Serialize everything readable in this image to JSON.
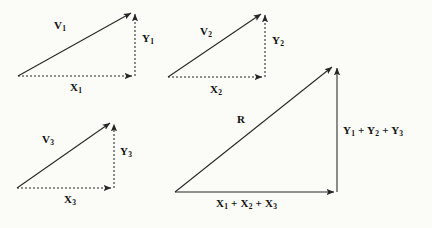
{
  "figure": {
    "type": "vector-addition-diagram",
    "background_color": "#fbfbf8",
    "line_color": "#262626",
    "text_color": "#101010"
  },
  "triangles": [
    {
      "id": "triangle-1",
      "vector_label": "V",
      "vector_sub": "1",
      "y_label": "Y",
      "y_sub": "1",
      "x_label": "X",
      "x_sub": "1",
      "origin": [
        18,
        76
      ],
      "apex": [
        134,
        11
      ],
      "corner": [
        134,
        76
      ],
      "hypotenuse_style": "solid",
      "leg_style": "dashed"
    },
    {
      "id": "triangle-2",
      "vector_label": "V",
      "vector_sub": "2",
      "y_label": "Y",
      "y_sub": "2",
      "x_label": "X",
      "x_sub": "2",
      "origin": [
        168,
        77
      ],
      "apex": [
        264,
        12
      ],
      "corner": [
        264,
        77
      ],
      "hypotenuse_style": "solid",
      "leg_style": "dashed"
    },
    {
      "id": "triangle-3",
      "vector_label": "V",
      "vector_sub": "3",
      "y_label": "Y",
      "y_sub": "3",
      "x_label": "X",
      "x_sub": "3",
      "origin": [
        17,
        188
      ],
      "apex": [
        113,
        121
      ],
      "corner": [
        113,
        188
      ],
      "hypotenuse_style": "solid",
      "leg_style": "dashed"
    }
  ],
  "resultant": {
    "id": "triangle-resultant",
    "vector_label": "R",
    "y_label_parts": [
      "Y",
      "1",
      " + ",
      "Y",
      "2",
      " + ",
      "Y",
      "3"
    ],
    "x_label_parts": [
      "X",
      "1",
      " + ",
      "X",
      "2",
      " + ",
      "X",
      "3"
    ],
    "y_label_text": "Y1 + Y2 + Y3",
    "x_label_text": "X1 + X2 + X3",
    "origin": [
      175,
      192
    ],
    "apex": [
      335,
      65
    ],
    "corner": [
      335,
      192
    ],
    "hypotenuse_style": "solid",
    "leg_style": "solid"
  },
  "labels": {
    "v1": {
      "base": "V",
      "sub": "1",
      "x": 54,
      "y": 20
    },
    "y1": {
      "base": "Y",
      "sub": "1",
      "x": 142,
      "y": 33
    },
    "x1": {
      "base": "X",
      "sub": "1",
      "x": 70,
      "y": 82
    },
    "v2": {
      "base": "V",
      "sub": "2",
      "x": 200,
      "y": 26
    },
    "y2": {
      "base": "Y",
      "sub": "2",
      "x": 272,
      "y": 35
    },
    "x2": {
      "base": "X",
      "sub": "2",
      "x": 210,
      "y": 84
    },
    "v3": {
      "base": "V",
      "sub": "3",
      "x": 42,
      "y": 134
    },
    "y3": {
      "base": "Y",
      "sub": "3",
      "x": 120,
      "y": 146
    },
    "x3": {
      "base": "X",
      "sub": "3",
      "x": 64,
      "y": 194
    },
    "r": {
      "base": "R",
      "sub": "",
      "x": 237,
      "y": 114
    },
    "ysum": {
      "x": 343,
      "y": 125
    },
    "xsum": {
      "x": 216,
      "y": 198
    }
  }
}
